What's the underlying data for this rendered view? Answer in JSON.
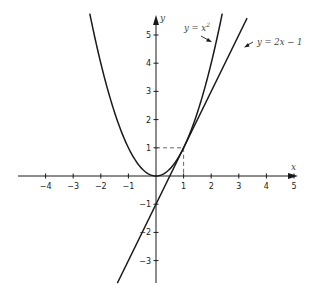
{
  "chart_data": {
    "type": "line",
    "title": "",
    "xlabel": "x",
    "ylabel": "y",
    "xlim": [
      -5,
      5
    ],
    "ylim": [
      -3.8,
      5.8
    ],
    "grid": false,
    "x_ticks": [
      -4,
      -3,
      -2,
      -1,
      1,
      2,
      3,
      4,
      5
    ],
    "y_ticks": [
      -3,
      -2,
      -1,
      1,
      2,
      3,
      4,
      5
    ],
    "x_tick_labels": [
      "−4",
      "−3",
      "−2",
      "−1",
      "1",
      "2",
      "3",
      "4",
      "5"
    ],
    "y_tick_labels": [
      "−3",
      "−2",
      "−1",
      "1",
      "2",
      "3",
      "4",
      "5"
    ],
    "series": [
      {
        "name": "y = x²",
        "function": "x^2",
        "x_range": [
          -2.4,
          2.4
        ],
        "points": [
          [
            -2.4,
            5.76
          ],
          [
            -2,
            4
          ],
          [
            -1,
            1
          ],
          [
            0,
            0
          ],
          [
            1,
            1
          ],
          [
            2,
            4
          ],
          [
            2.4,
            5.76
          ]
        ]
      },
      {
        "name": "y = 2x − 1",
        "function": "2x-1",
        "x_range": [
          -1.4,
          3.3
        ],
        "points": [
          [
            -1.4,
            -3.8
          ],
          [
            0,
            -1
          ],
          [
            0.5,
            0
          ],
          [
            1,
            1
          ],
          [
            3.3,
            5.6
          ]
        ]
      }
    ],
    "annotations": [
      {
        "type": "label-arrow",
        "text": "y = x²",
        "points_to": "parabola"
      },
      {
        "type": "label-arrow",
        "text": "y = 2x − 1",
        "points_to": "tangent-line"
      },
      {
        "type": "dashed-guide",
        "from": [
          0,
          1
        ],
        "to": [
          1,
          1
        ]
      },
      {
        "type": "dashed-guide",
        "from": [
          1,
          0
        ],
        "to": [
          1,
          1
        ]
      },
      {
        "type": "tangent-point",
        "at": [
          1,
          1
        ]
      }
    ]
  },
  "labels": {
    "x_axis": "x",
    "y_axis": "y",
    "parabola_eq_lhs": "y = x",
    "parabola_eq_exp": "2",
    "line_eq": "y = 2x − 1"
  },
  "colors": {
    "curve": "#1a1a1a",
    "axis": "#1a1a1a",
    "text": "#333333",
    "dashed": "#555555"
  }
}
